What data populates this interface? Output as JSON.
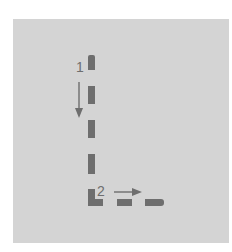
{
  "diagram": {
    "background_color": "#d4d4d4",
    "stroke_color": "#6e6e6e",
    "steps": [
      {
        "label": "1",
        "direction": "down"
      },
      {
        "label": "2",
        "direction": "right"
      }
    ],
    "shape": "L-shaped dashed path"
  }
}
